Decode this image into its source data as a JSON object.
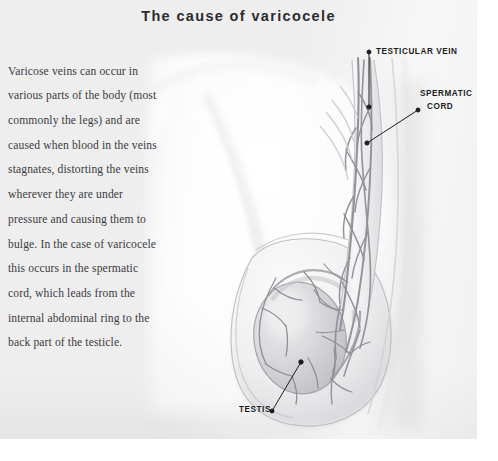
{
  "document": {
    "title": "The cause of varicocele",
    "body_paragraph": "Varicose veins can occur in various parts of the body (most commonly the legs) and are caused when blood in the veins stagnates, distorting the veins wherever they are under pressure and causing them to bulge. In the case of varicocele this occurs in the spermatic cord, which leads from the internal abdominal ring to the back part of the testicle.",
    "background_color": "#eeeeee",
    "page_color": "#ffffff",
    "text_color": "#3b3b40",
    "title_color": "#2b2b2f"
  },
  "illustration": {
    "name": "varicocele-anatomy-illustration",
    "description": "Grayscale medical illustration of the male inguinal region showing the spermatic cord with a dilated pampiniform venous plexus and the testis within the scrotum.",
    "line_color": "#8d8d92",
    "shade_color": "#d6d6d8",
    "leader_color": "#1d1d21"
  },
  "labels": [
    {
      "id": "testicular-vein",
      "text": "TESTICULAR VEIN",
      "dot_start_x": 369,
      "dot_start_y": 52,
      "dot_end_x": 369,
      "dot_end_y": 107
    },
    {
      "id": "spermatic-cord",
      "line1": "SPERMATIC",
      "line2": "CORD",
      "dot_start_x": 418,
      "dot_start_y": 110,
      "dot_end_x": 367,
      "dot_end_y": 143
    },
    {
      "id": "testis",
      "text": "TESTIS",
      "dot_start_x": 272,
      "dot_start_y": 411,
      "dot_end_x": 301,
      "dot_end_y": 362
    }
  ]
}
